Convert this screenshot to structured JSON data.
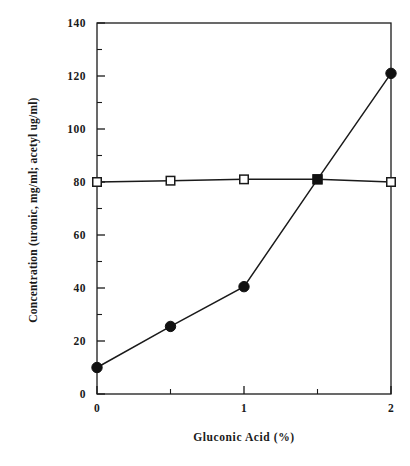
{
  "chart_data": {
    "type": "line",
    "title": "",
    "xlabel": "Gluconic Acid  (%)",
    "ylabel": "Concentration (uronic, mg/ml; acetyl ug/ml)",
    "xlim": [
      0,
      2
    ],
    "ylim": [
      0,
      140
    ],
    "grid": false,
    "legend_position": "none",
    "x_major_ticks": [
      0,
      1,
      2
    ],
    "x_major_tick_labels": [
      "0",
      "1",
      "2"
    ],
    "x_minor_ticks": [
      0.5,
      1.5
    ],
    "y_major_ticks": [
      0,
      20,
      40,
      60,
      80,
      100,
      120,
      140
    ],
    "y_major_tick_labels": [
      "0",
      "20",
      "40",
      "60",
      "80",
      "100",
      "120",
      "140"
    ],
    "y_minor_ticks": [
      10,
      30,
      50,
      70,
      90,
      110,
      130
    ],
    "x": [
      0,
      0.5,
      1,
      1.5,
      2
    ],
    "series": [
      {
        "name": "uronic acid",
        "marker": "filled-circle",
        "color": "#111111",
        "values": [
          10,
          25.5,
          40.5,
          81,
          121
        ]
      },
      {
        "name": "acetyl",
        "marker": "open-square",
        "color": "#1a1a1a",
        "values": [
          80,
          80.5,
          81,
          81,
          80
        ]
      }
    ]
  },
  "axes": {
    "x_title": "Gluconic Acid  (%)",
    "y_title": "Concentration (uronic, mg/ml; acetyl ug/ml)"
  },
  "ytick_labels": [
    "0",
    "20",
    "40",
    "60",
    "80",
    "100",
    "120",
    "140"
  ],
  "xtick_labels": [
    "0",
    "1",
    "2"
  ],
  "caption": ""
}
